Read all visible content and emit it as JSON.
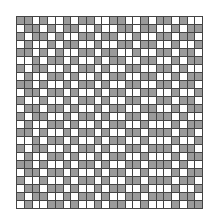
{
  "grid": {
    "rows": 24,
    "cols": 24,
    "fill_color": "#9a9a9a",
    "empty_color": "#ffffff",
    "line_color": "#444444",
    "cells": [
      "110100101100110010110100",
      "011010110010011011001011",
      "101101001101100100110110",
      "010010110010011011001001",
      "110101001101100100110110",
      "001011010010110011001011",
      "101100101101001100110100",
      "010011010010110011001011",
      "110100101101001100110110",
      "011011010010110011001001",
      "100100101101001100110110",
      "011011010010110011001011",
      "101100101101001101110100",
      "010011010010110010001011",
      "110100101101001101110110",
      "001011010010110010001001",
      "101100101101001101110110",
      "010011010010110010001011",
      "110100101101001101110100",
      "011011010010110010001011",
      "100100101101001101110110",
      "011011010010110010001001",
      "101100101101001101110110",
      "010011010010110010001011"
    ]
  }
}
